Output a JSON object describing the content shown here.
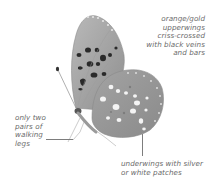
{
  "diagram": {
    "annotations": [
      {
        "id": "upperwings",
        "lines": [
          "orange/gold",
          "upperwings",
          "criss-crossed",
          "with black veins",
          "and bars"
        ]
      },
      {
        "id": "legs",
        "lines": [
          "only two",
          "pairs of",
          "walking",
          "legs"
        ]
      },
      {
        "id": "underwings",
        "lines": [
          "underwings with silver",
          "or white patches"
        ]
      }
    ],
    "colors": {
      "text": "#6a6a6a",
      "wing_base": "#a8a8a8",
      "wing_dark": "#8c8c8c",
      "spots_dark": "#2a2a2a",
      "spots_light": "#f2f2f2",
      "leader_line": "#7d7d7d"
    }
  }
}
